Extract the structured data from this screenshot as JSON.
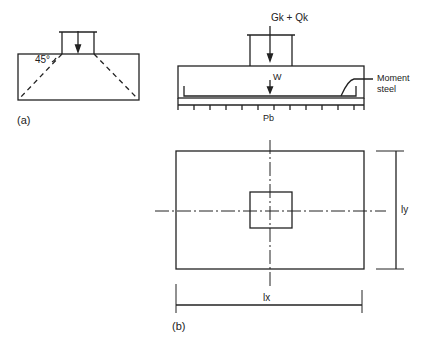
{
  "figure_a": {
    "caption": "(a)",
    "angle_label": "45°"
  },
  "figure_b_section": {
    "load_label": "Gk + Qk",
    "self_weight_label": "W",
    "steel_label_line1": "Moment",
    "steel_label_line2": "steel",
    "pressure_label": "Pb"
  },
  "figure_b_plan": {
    "ly_label": "ly",
    "lx_label": "lx",
    "caption": "(b)"
  }
}
